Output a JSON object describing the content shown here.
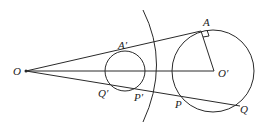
{
  "diagram": {
    "labels": {
      "O": "O",
      "O_prime": "O′",
      "A": "A",
      "A_prime": "A′",
      "P": "P",
      "P_prime": "P′",
      "Q": "Q",
      "Q_prime": "Q′"
    },
    "stroke_color": "#2a2a2a"
  }
}
